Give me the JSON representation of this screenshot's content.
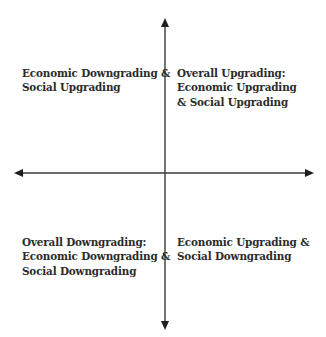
{
  "diagram": {
    "type": "quadrant",
    "axes": {
      "vertical": {
        "direction": "bidirectional",
        "arrows": [
          "up-arrow",
          "down-arrow"
        ]
      },
      "horizontal": {
        "direction": "bidirectional",
        "arrows": [
          "left-arrow",
          "right-arrow"
        ]
      }
    },
    "colors": {
      "axis": "#3a3a3a",
      "text": "#2b2b2b",
      "background": "#ffffff"
    },
    "quadrants": {
      "top_left": {
        "lines": [
          "Economic Downgrading &",
          "Social Upgrading"
        ]
      },
      "top_right": {
        "lines": [
          "Overall Upgrading:",
          "Economic Upgrading",
          "& Social Upgrading"
        ]
      },
      "bottom_left": {
        "lines": [
          "Overall Downgrading:",
          "Economic Downgrading &",
          "Social Downgrading"
        ]
      },
      "bottom_right": {
        "lines": [
          "Economic Upgrading &",
          "Social Downgrading"
        ]
      }
    }
  }
}
